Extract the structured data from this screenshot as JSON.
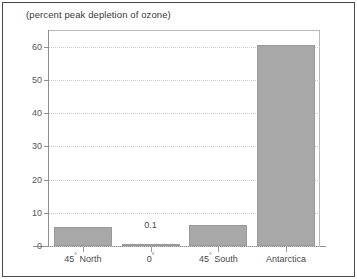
{
  "chart_data": {
    "type": "bar",
    "title": "(percent peak depletion of ozone)",
    "xlabel": "",
    "ylabel": "",
    "ylim": [
      0,
      65
    ],
    "yticks": [
      0,
      10,
      20,
      30,
      40,
      50,
      60
    ],
    "grid": true,
    "legend": false,
    "categories": [
      "45° North",
      "0°",
      "45° South",
      "Antarctica"
    ],
    "values": [
      5.8,
      0.1,
      6.4,
      60.5
    ],
    "annotations": [
      {
        "text": "0.1",
        "category": "0°",
        "value": 0.1
      }
    ],
    "series": [
      {
        "name": "peak ozone depletion",
        "values": [
          5.8,
          0.1,
          6.4,
          60.5
        ]
      }
    ]
  },
  "categories_parts": [
    {
      "number": "45",
      "degree": "°",
      "suffix": " North"
    },
    {
      "number": "0",
      "degree": "°",
      "suffix": ""
    },
    {
      "number": "45",
      "degree": "°",
      "suffix": " South"
    },
    {
      "number": "Antarctica",
      "degree": "",
      "suffix": ""
    }
  ],
  "colors": {
    "bar_fill": "#a8a8a8",
    "bar_edge": "#9a9a9a",
    "grid": "#c9c9c9",
    "axis": "#8f8f8f",
    "frame": "#4a4a4a",
    "text": "#4a4a4a",
    "background": "#ffffff"
  }
}
